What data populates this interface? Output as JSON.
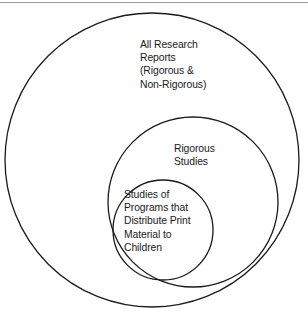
{
  "figure": {
    "type": "venn-nested-circles",
    "background_color": "#ffffff",
    "stroke_color": "#1a1a1a",
    "text_color": "#1b1b1b",
    "rule_color": "#9a9a9a",
    "circles": [
      {
        "name": "all-research-reports",
        "label": "All Research\nReports\n(Rigorous &\nNon-Rigorous)",
        "cx": 152,
        "cy": 160,
        "r": 147
      },
      {
        "name": "rigorous-studies",
        "label": "Rigorous\nStudies",
        "cx": 193,
        "cy": 202,
        "r": 85
      },
      {
        "name": "studies-print-material",
        "label": "Studies of\nPrograms that\nDistribute Print\nMaterial to\nChildren",
        "cx": 163,
        "cy": 230,
        "r": 50
      }
    ]
  }
}
